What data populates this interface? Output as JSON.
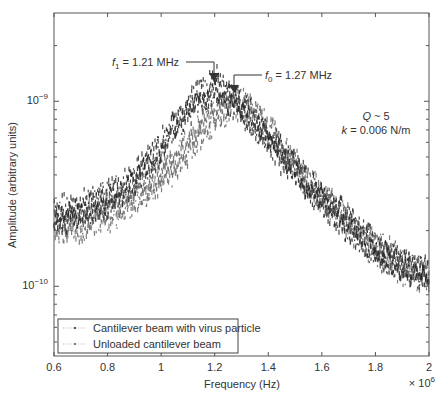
{
  "chart_data": {
    "type": "scatter",
    "title": "",
    "xlabel": "Frequency (Hz)",
    "ylabel": "Amplitude (arbitrary units)",
    "x_multiplier": "× 10^6",
    "xlim": [
      0.6,
      2.0
    ],
    "ylim": [
      4.2e-11,
      3e-09
    ],
    "yscale": "log",
    "x_ticks": [
      0.6,
      0.8,
      1,
      1.2,
      1.4,
      1.6,
      1.8,
      2
    ],
    "x_tick_labels": [
      "0.6",
      "0.8",
      "1",
      "1.2",
      "1.4",
      "1.6",
      "1.8",
      "2"
    ],
    "y_ticks": [
      1e-10,
      1e-09
    ],
    "y_tick_labels": [
      "10^-10",
      "10^-9"
    ],
    "grid": false,
    "legend_position": "lower left",
    "series": [
      {
        "name": "Cantilever beam with virus particle",
        "color": "#2a2a2a",
        "x": [
          0.6,
          0.7,
          0.8,
          0.9,
          1.0,
          1.05,
          1.1,
          1.15,
          1.2,
          1.21,
          1.25,
          1.3,
          1.35,
          1.4,
          1.5,
          1.6,
          1.7,
          1.8,
          1.9,
          2.0
        ],
        "values": [
          2.4e-10,
          2.6e-10,
          3e-10,
          3.8e-10,
          5.6e-10,
          7.2e-10,
          9e-10,
          1.1e-09,
          1.2e-09,
          1.22e-09,
          1.1e-09,
          9.2e-10,
          7.6e-10,
          6.2e-10,
          4.2e-10,
          2.9e-10,
          2.2e-10,
          1.6e-10,
          1.3e-10,
          1.15e-10
        ]
      },
      {
        "name": "Unloaded cantilever beam",
        "color": "#6a6a6a",
        "x": [
          0.6,
          0.7,
          0.8,
          0.9,
          1.0,
          1.05,
          1.1,
          1.15,
          1.2,
          1.25,
          1.27,
          1.3,
          1.35,
          1.4,
          1.5,
          1.6,
          1.7,
          1.8,
          1.9,
          2.0
        ],
        "values": [
          2.1e-10,
          2.2e-10,
          2.5e-10,
          3e-10,
          3.9e-10,
          4.6e-10,
          5.6e-10,
          7e-10,
          8.4e-10,
          9.6e-10,
          1e-09,
          9.6e-10,
          8.2e-10,
          6.8e-10,
          4.5e-10,
          3e-10,
          2.2e-10,
          1.6e-10,
          1.3e-10,
          1.13e-10
        ]
      }
    ],
    "annotations": [
      {
        "label_var": "f",
        "label_sub": "1",
        "text": " = 1.21 MHz",
        "x": 1.21,
        "note": "arrow pointing to loaded peak"
      },
      {
        "label_var": "f",
        "label_sub": "0",
        "text": " = 1.27 MHz",
        "x": 1.27,
        "note": "arrow pointing to unloaded peak"
      },
      {
        "text": "Q ~ 5"
      },
      {
        "text": "k = 0.006 N/m"
      }
    ]
  },
  "labels": {
    "xlabel": "Frequency (Hz)",
    "ylabel": "Amplitude (arbitrary units)",
    "x_multiplier_base": "× 10",
    "x_multiplier_exp": "6",
    "y_tick_1e-9_base": "10",
    "y_tick_1e-9_exp": "−9",
    "y_tick_1e-10_base": "10",
    "y_tick_1e-10_exp": "−10",
    "f1_var": "f",
    "f1_sub": "1",
    "f1_value": " = 1.21 MHz",
    "f0_var": "f",
    "f0_sub": "0",
    "f0_value": " = 1.27 MHz",
    "q_var": "Q",
    "q_value": " ~ 5",
    "k_var": "k",
    "k_value": " = 0.006 N/m",
    "legend_loaded": "Cantilever beam with virus particle",
    "legend_unloaded": "Unloaded cantilever beam"
  }
}
